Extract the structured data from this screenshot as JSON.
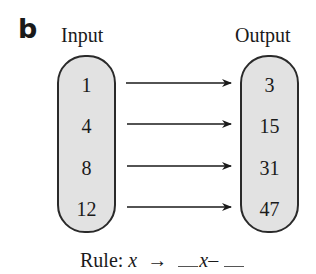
{
  "figure": {
    "panel_label": "b",
    "input_title": "Input",
    "output_title": "Output",
    "inputs": [
      "1",
      "4",
      "8",
      "12"
    ],
    "outputs": [
      "3",
      "15",
      "31",
      "47"
    ],
    "rule": {
      "prefix": "Rule:",
      "variable": "x",
      "arrow": "→",
      "expr_variable": "x",
      "operator": "–"
    },
    "colors": {
      "capsule_fill": "#e2e2e2",
      "stroke": "#2a2a2a"
    }
  }
}
